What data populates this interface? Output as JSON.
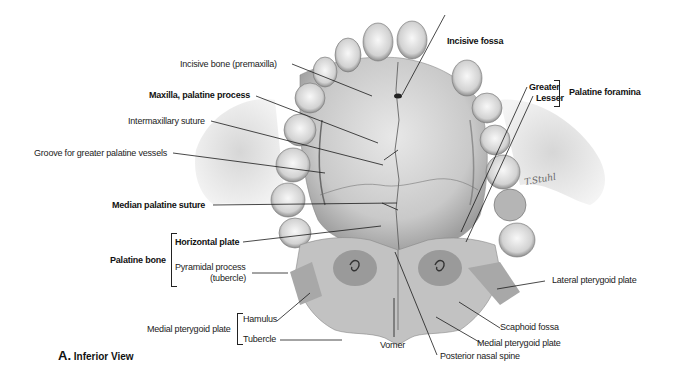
{
  "figure": {
    "caption_letter": "A.",
    "caption_text": "Inferior View",
    "labels": {
      "incisive_bone": "Incisive bone (premaxilla)",
      "maxilla_palatine_process": "Maxilla, palatine process",
      "intermaxillary_suture": "Intermaxillary suture",
      "groove_greater_palatine": "Groove for greater palatine vessels",
      "median_palatine_suture": "Median palatine suture",
      "palatine_bone": "Palatine bone",
      "horizontal_plate": "Horizontal plate",
      "pyramidal_process": "Pyramidal process",
      "pyramidal_process_sub": "(tubercle)",
      "medial_pterygoid_plate_left": "Medial pterygoid plate",
      "hamulus": "Hamulus",
      "tubercle": "Tubercle",
      "incisive_fossa": "Incisive fossa",
      "greater": "Greater",
      "lesser": "Lesser",
      "palatine_foramina": "Palatine foramina",
      "lateral_pterygoid_plate": "Lateral pterygoid plate",
      "scaphoid_fossa": "Scaphoid fossa",
      "medial_pterygoid_plate_right": "Medial pterygoid plate",
      "vomer": "Vomer",
      "posterior_nasal_spine": "Posterior nasal spine"
    },
    "signature": "T.Stuhl"
  }
}
